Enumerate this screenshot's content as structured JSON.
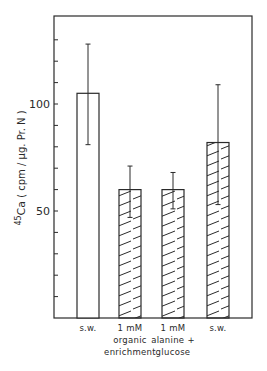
{
  "chart_data": {
    "type": "bar",
    "title": "",
    "xlabel": "",
    "ylabel": "45Ca (cpm / µg. Pr. N)",
    "ylabel_parts": {
      "sup": "45",
      "base": "Ca",
      "rest": " ( cpm / µg. Pr. N )"
    },
    "ylim": [
      0,
      141
    ],
    "yticks": [
      10,
      20,
      30,
      40,
      50,
      60,
      70,
      80,
      90,
      100,
      110,
      120,
      130
    ],
    "ytick_labels": [
      {
        "value": 50,
        "label": "50"
      },
      {
        "value": 100,
        "label": "100"
      }
    ],
    "categories": [
      [
        "s.w."
      ],
      [
        "1 mM",
        "organic",
        "enrichment"
      ],
      [
        "1 mM",
        "alanine +",
        "glucose"
      ],
      [
        "s.w."
      ]
    ],
    "values": [
      105,
      60,
      60,
      82
    ],
    "error_bars": [
      {
        "low": 81,
        "high": 128
      },
      {
        "low": 47,
        "high": 71
      },
      {
        "low": 51,
        "high": 68
      },
      {
        "low": 53,
        "high": 109
      }
    ],
    "fill_patterns": [
      "none",
      "hatched",
      "hatched",
      "hatched"
    ],
    "grid": false,
    "legend": null
  },
  "colors": {
    "ink": "#2a2a2a",
    "background": "#ffffff"
  }
}
